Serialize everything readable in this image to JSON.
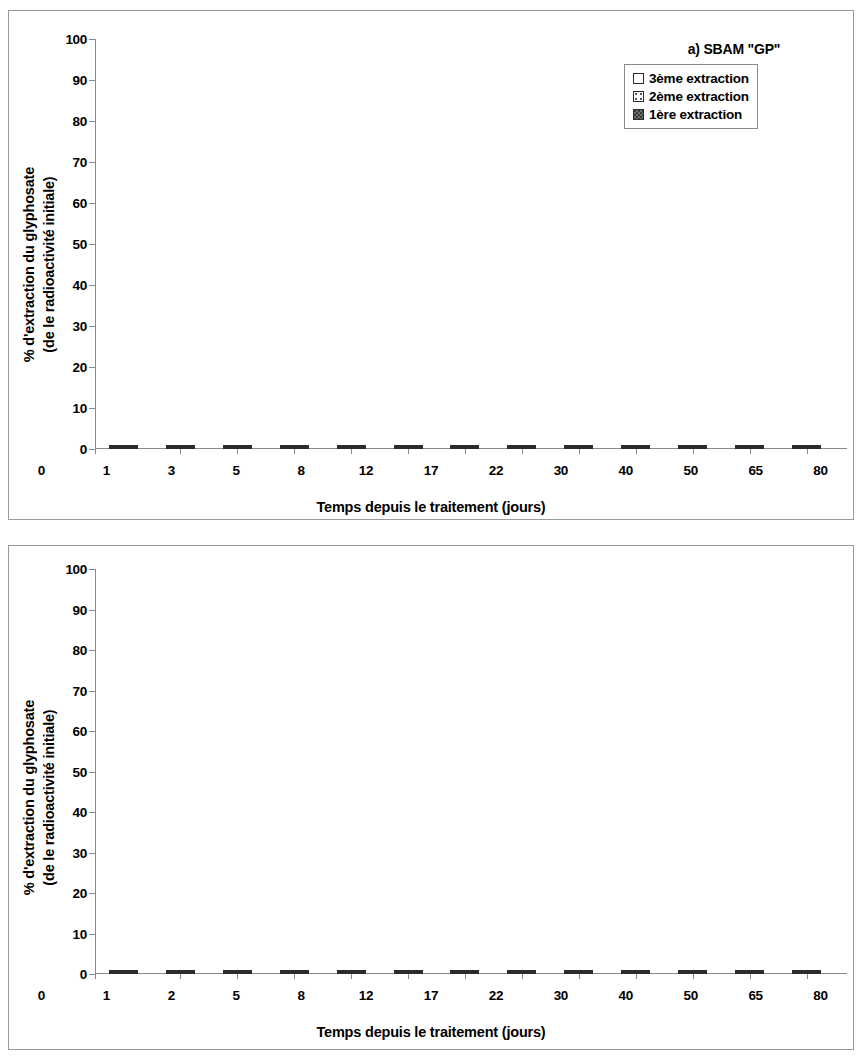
{
  "chart_data": [
    {
      "type": "bar",
      "stacked": true,
      "panel_label": "a) SBAM \"GP\"",
      "title": "",
      "xlabel": "Temps depuis le traitement (jours)",
      "ylabel": "% d'extraction du glyphosate\n(de le radioactivité initiale)",
      "ylabel_line1": "% d'extraction du glyphosate",
      "ylabel_line2": "(de le radioactivité initiale)",
      "ylim": [
        0,
        100
      ],
      "yticks": [
        100,
        90,
        80,
        70,
        60,
        50,
        40,
        30,
        20,
        10,
        0
      ],
      "grid": false,
      "legend_position": "top-right",
      "categories": [
        "0",
        "1",
        "3",
        "5",
        "8",
        "12",
        "17",
        "22",
        "30",
        "40",
        "50",
        "65",
        "80"
      ],
      "series": [
        {
          "name": "1ère  extraction",
          "values": [
            50.3,
            40.5,
            37.2,
            33.2,
            27.1,
            22.4,
            17.6,
            14.5,
            11.4,
            9.3,
            8.3,
            6.7,
            6.4
          ]
        },
        {
          "name": "2ème extraction",
          "values": [
            21.2,
            18.8,
            15.1,
            14.6,
            14.3,
            12.4,
            8.2,
            6.9,
            6.4,
            5.2,
            4.7,
            3.7,
            4.8
          ]
        },
        {
          "name": "3ème extraction",
          "values": [
            10.4,
            8.3,
            8.4,
            7.2,
            6.9,
            5.8,
            5.0,
            3.7,
            3.6,
            3.3,
            3.2,
            2.6,
            2.7
          ]
        }
      ],
      "totals": [
        81.9,
        67.6,
        60.7,
        55.0,
        48.3,
        40.6,
        30.8,
        25.1,
        21.4,
        17.8,
        16.2,
        13.0,
        13.9
      ]
    },
    {
      "type": "bar",
      "stacked": true,
      "panel_label": "b) SBAM \"GG\"",
      "title": "",
      "xlabel": "Temps depuis le traitement (jours)",
      "ylabel": "% d'extraction du glyphosate\n(de le radioactivité initiale)",
      "ylabel_line1": "% d'extraction du glyphosate",
      "ylabel_line2": "(de le radioactivité initiale)",
      "ylim": [
        0,
        100
      ],
      "yticks": [
        100,
        90,
        80,
        70,
        60,
        50,
        40,
        30,
        20,
        10,
        0
      ],
      "grid": false,
      "legend_position": "top-right",
      "categories": [
        "0",
        "1",
        "2",
        "5",
        "8",
        "12",
        "17",
        "22",
        "30",
        "40",
        "50",
        "65",
        "80"
      ],
      "series": [
        {
          "name": "1ère  extraction",
          "values": [
            52.7,
            41.0,
            36.6,
            33.6,
            28.9,
            21.1,
            17.2,
            13.2,
            11.7,
            8.6,
            8.2,
            6.1,
            5.6
          ]
        },
        {
          "name": "2ème extraction",
          "values": [
            20.6,
            18.4,
            15.4,
            15.2,
            14.4,
            11.4,
            8.0,
            6.6,
            6.8,
            5.3,
            4.0,
            3.1,
            3.9
          ]
        },
        {
          "name": "3ème extraction",
          "values": [
            10.2,
            8.6,
            8.0,
            7.7,
            7.2,
            5.4,
            4.8,
            3.6,
            3.6,
            3.8,
            3.0,
            2.0,
            2.3
          ]
        }
      ],
      "totals": [
        83.5,
        68.0,
        60.0,
        56.5,
        50.5,
        37.9,
        30.0,
        23.4,
        22.1,
        17.7,
        15.2,
        11.2,
        11.8
      ]
    }
  ],
  "legend": {
    "rows": [
      {
        "label": "3ème extraction",
        "swatch": "white-square-swatch"
      },
      {
        "label": "2ème extraction",
        "swatch": "dotted-square-swatch"
      },
      {
        "label": "1ère  extraction",
        "swatch": "dark-stipple-square-swatch"
      }
    ]
  },
  "colors": {
    "series1": "#6e6e6e",
    "series2": "#ffffff",
    "series3": "#ffffff",
    "outline": "#2b2b2b",
    "axis": "#8a8a8a",
    "panel_border": "#9a9a9a"
  }
}
